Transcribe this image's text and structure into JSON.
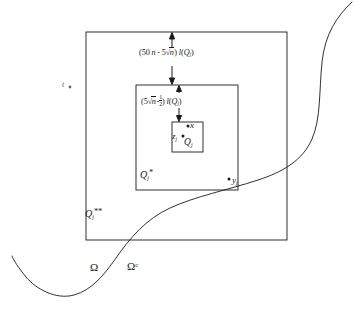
{
  "figure": {
    "type": "geometric-diagram",
    "stroke_color": "#1a1a1a",
    "background_color": "#ffffff"
  },
  "squares": {
    "outer": {
      "label_main": "Q",
      "label_sub": "j",
      "label_sup": "**",
      "x": 86,
      "y": 32,
      "size": 201
    },
    "middle": {
      "label_main": "Q",
      "label_sub": "j",
      "label_sup": "*",
      "x": 136,
      "y": 85,
      "size": 102
    },
    "inner": {
      "label_main": "Q",
      "label_sub": "j",
      "label_sup": "",
      "x": 172,
      "y": 122,
      "size": 31
    }
  },
  "annotations": {
    "outer_gap": {
      "open_paren": "(",
      "coef": "50",
      "var_n": "n",
      "minus": "-",
      "coef2": "5",
      "radical": "√",
      "radicand": "n",
      "close_paren": ")",
      "length_fn": "l",
      "length_arg_open": "(",
      "length_arg": "Q",
      "length_arg_sub": "j",
      "length_arg_close": ")"
    },
    "inner_gap": {
      "open_paren": "(",
      "coef": "5",
      "radical": "√",
      "radicand": "n",
      "minus": "-",
      "frac_num": "1",
      "frac_den": "2",
      "close_paren": ")",
      "length_fn": "l",
      "length_arg_open": "(",
      "length_arg": "Q",
      "length_arg_sub": "j",
      "length_arg_close": ")"
    }
  },
  "points": {
    "x": {
      "label": "x",
      "dot_x": 188,
      "dot_y": 126
    },
    "z": {
      "label": "z",
      "sub": "j",
      "dot_x": 183,
      "dot_y": 136
    },
    "y": {
      "label": "y",
      "sub": "j",
      "dot_x": 229,
      "dot_y": 179
    },
    "t": {
      "label": "t",
      "dot_x": 70,
      "dot_y": 87
    }
  },
  "regions": {
    "omega": "Ω",
    "omega_complement_base": "Ω",
    "omega_complement_sup": "c"
  }
}
